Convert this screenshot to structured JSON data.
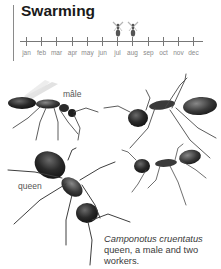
{
  "header": {
    "title": "Swarming"
  },
  "timeline": {
    "months": [
      "jan",
      "feb",
      "mar",
      "apr",
      "may",
      "jun",
      "jul",
      "aug",
      "sep",
      "oct",
      "nov",
      "dec"
    ],
    "swarming_months": [
      "jul",
      "aug"
    ],
    "swarm_icon": "winged-ant-icon",
    "colors": {
      "line": "#777777",
      "labels": "#8a8a8a",
      "icon": "#555555"
    }
  },
  "figure": {
    "labels": {
      "male": "mâle",
      "queen": "queen"
    },
    "caption": {
      "species": "Camponotus cruentatus",
      "rest": " queen, a male and two workers."
    }
  }
}
